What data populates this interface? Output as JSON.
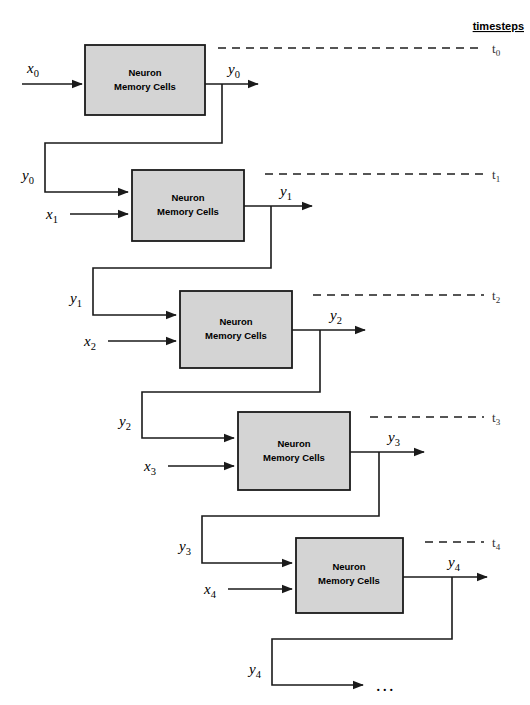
{
  "figure": {
    "title_legend": "timesteps",
    "block_label_line1": "Neuron",
    "block_label_line2": "Memory Cells",
    "continuation": "...",
    "colors": {
      "block_fill": "#d4d4d4",
      "block_stroke": "#1a1a1a",
      "line": "#1a1a1a",
      "dashed_line": "#555555",
      "background": "#ffffff"
    }
  },
  "timesteps": [
    {
      "id": "t0",
      "base": "t",
      "sub": "0"
    },
    {
      "id": "t1",
      "base": "t",
      "sub": "1"
    },
    {
      "id": "t2",
      "base": "t",
      "sub": "2"
    },
    {
      "id": "t3",
      "base": "t",
      "sub": "3"
    },
    {
      "id": "t4",
      "base": "t",
      "sub": "4"
    }
  ],
  "stages": [
    {
      "index": 0,
      "block_line1": "Neuron",
      "block_line2": "Memory Cells",
      "input_x": {
        "base": "x",
        "sub": "0"
      },
      "output_y": {
        "base": "y",
        "sub": "0"
      },
      "recurrent_in": null
    },
    {
      "index": 1,
      "block_line1": "Neuron",
      "block_line2": "Memory Cells",
      "input_x": {
        "base": "x",
        "sub": "1"
      },
      "output_y": {
        "base": "y",
        "sub": "1"
      },
      "recurrent_in": {
        "base": "y",
        "sub": "0"
      }
    },
    {
      "index": 2,
      "block_line1": "Neuron",
      "block_line2": "Memory Cells",
      "input_x": {
        "base": "x",
        "sub": "2"
      },
      "output_y": {
        "base": "y",
        "sub": "2"
      },
      "recurrent_in": {
        "base": "y",
        "sub": "1"
      }
    },
    {
      "index": 3,
      "block_line1": "Neuron",
      "block_line2": "Memory Cells",
      "input_x": {
        "base": "x",
        "sub": "3"
      },
      "output_y": {
        "base": "y",
        "sub": "3"
      },
      "recurrent_in": {
        "base": "y",
        "sub": "2"
      }
    },
    {
      "index": 4,
      "block_line1": "Neuron",
      "block_line2": "Memory Cells",
      "input_x": {
        "base": "x",
        "sub": "4"
      },
      "output_y": {
        "base": "y",
        "sub": "4"
      },
      "recurrent_in": {
        "base": "y",
        "sub": "3"
      }
    }
  ],
  "tail": {
    "recurrent_out": {
      "base": "y",
      "sub": "4"
    },
    "ellipsis": "..."
  }
}
